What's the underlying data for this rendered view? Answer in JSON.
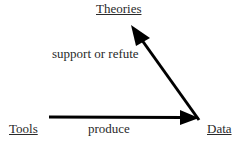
{
  "diagram": {
    "nodes": [
      {
        "id": "theories",
        "label": "Theories"
      },
      {
        "id": "tools",
        "label": "Tools"
      },
      {
        "id": "data",
        "label": "Data"
      }
    ],
    "edges": [
      {
        "from": "tools",
        "to": "data",
        "label": "produce"
      },
      {
        "from": "data",
        "to": "theories",
        "label": "support or refute"
      }
    ],
    "colors": {
      "arrow": "#000000",
      "text": "#2a2a2a",
      "background": "#ffffff"
    }
  }
}
